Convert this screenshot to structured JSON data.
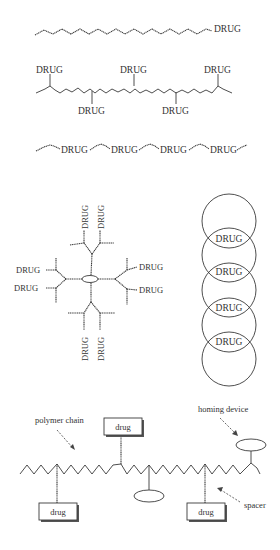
{
  "figure": {
    "panels": [
      {
        "id": "linear-end-conjugate",
        "labels": [
          "DRUG"
        ]
      },
      {
        "id": "pendant-conjugate",
        "labels_top": [
          "DRUG",
          "DRUG",
          "DRUG"
        ],
        "labels_bottom": [
          "DRUG",
          "DRUG"
        ]
      },
      {
        "id": "backbone-conjugate",
        "labels": [
          "DRUG",
          "DRUG",
          "DRUG",
          "DRUG"
        ]
      },
      {
        "id": "dendrimer-conjugate",
        "labels_top": [
          "DRUG",
          "DRUG"
        ],
        "labels_left": [
          "DRUG",
          "DRUG"
        ],
        "labels_right": [
          "DRUG",
          "DRUG"
        ],
        "labels_bottom": [
          "DRUG",
          "DRUG"
        ]
      },
      {
        "id": "overlapping-circles",
        "labels": [
          "DRUG",
          "DRUG",
          "DRUG",
          "DRUG"
        ]
      },
      {
        "id": "polymer-drug-model",
        "drug_boxes": [
          "drug",
          "drug",
          "drug"
        ],
        "annotations": {
          "polymer_chain": "polymer chain",
          "homing_device": "homing device",
          "spacer": "spacer"
        }
      }
    ],
    "colors": {
      "line": "#3a3a3a",
      "text": "#333333",
      "background": "#ffffff"
    }
  }
}
